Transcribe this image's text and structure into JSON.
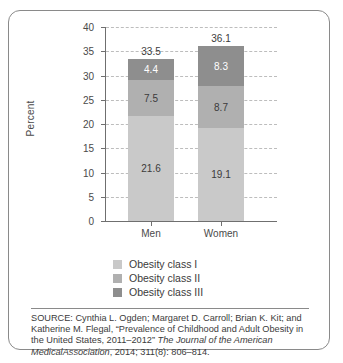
{
  "chart_data": {
    "type": "bar",
    "subtype": "stacked-bar",
    "title": "",
    "xlabel": "",
    "ylabel": "Percent",
    "ylim": [
      0,
      40
    ],
    "ytick_step": 5,
    "yticks": [
      40,
      35,
      30,
      25,
      20,
      15,
      10,
      5,
      0
    ],
    "grid": true,
    "grid_style": "dashed-horizontal",
    "legend_position": "below-plot",
    "categories": [
      "Men",
      "Women"
    ],
    "series": [
      {
        "name": "Obesity class I",
        "values": [
          21.6,
          19.1
        ],
        "color": "#c9c9c9",
        "label_color": "#3b3b3b"
      },
      {
        "name": "Obesity class II",
        "values": [
          7.5,
          8.7
        ],
        "color": "#b0b0b0",
        "label_color": "#3b3b3b"
      },
      {
        "name": "Obesity class III",
        "values": [
          4.4,
          8.3
        ],
        "color": "#8e8e8e",
        "label_color": "#ffffff"
      }
    ],
    "totals": [
      33.5,
      36.1
    ],
    "value_labels": {
      "Men": [
        "21.6",
        "7.5",
        "4.4"
      ],
      "Women": [
        "19.1",
        "8.7",
        "8.3"
      ]
    },
    "total_labels": [
      "33.5",
      "36.1"
    ]
  },
  "legend": {
    "items": [
      {
        "label": "Obesity class I",
        "color": "#c9c9c9"
      },
      {
        "label": "Obesity class II",
        "color": "#b0b0b0"
      },
      {
        "label": "Obesity class III",
        "color": "#8e8e8e"
      }
    ]
  },
  "axis": {
    "y_title": "Percent",
    "y_ticks": [
      "40",
      "35",
      "30",
      "25",
      "20",
      "15",
      "10",
      "5",
      "0"
    ],
    "x_categories": [
      "Men",
      "Women"
    ]
  },
  "source": {
    "line1": "SOURCE: Cynthia L. Ogden; Margaret D. Carroll; Brian K. Kit; and",
    "line2": "Katherine M. Flegal, “Prevalence of Childhood and Adult Obesity in",
    "line3_plain": "the United States, 2011–2012” ",
    "line3_italic": "The Journal of the American Medical",
    "line4_italic": "Association",
    "line4_plain": ", 2014; 311(8): 806–814."
  }
}
